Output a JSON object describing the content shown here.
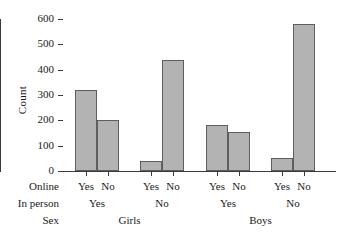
{
  "chart_data": {
    "type": "bar",
    "title": "",
    "xlabel": "",
    "ylabel": "Count",
    "ylim": [
      0,
      600
    ],
    "yticks": [
      0,
      100,
      200,
      300,
      400,
      500,
      600
    ],
    "grid": false,
    "legend": null,
    "categories": [
      "Girls / In person Yes / Online Yes",
      "Girls / In person Yes / Online No",
      "Girls / In person No / Online Yes",
      "Girls / In person No / Online No",
      "Boys / In person Yes / Online Yes",
      "Boys / In person Yes / Online No",
      "Boys / In person No / Online Yes",
      "Boys / In person No / Online No"
    ],
    "values": [
      320,
      200,
      40,
      440,
      180,
      155,
      50,
      580
    ],
    "bar_color": "#b3b3b3",
    "bar_border_color": "#5e5e5e",
    "axis_color": "#3a3a3a",
    "group_labels": {
      "level1_title": "Online",
      "level2_title": "In person",
      "level3_title": "Sex",
      "level1": [
        "Yes",
        "No",
        "Yes",
        "No",
        "Yes",
        "No",
        "Yes",
        "No"
      ],
      "level2": [
        "Yes",
        "No",
        "Yes",
        "No"
      ],
      "level3": [
        "Girls",
        "Boys"
      ]
    }
  },
  "axis": {
    "y_title": "Count",
    "y_tick_labels": [
      "600",
      "500",
      "400",
      "300",
      "200",
      "100",
      "0"
    ]
  },
  "labels": {
    "row1_title": "Online",
    "row2_title": "In person",
    "row3_title": "Sex",
    "online": [
      "Yes",
      "No",
      "Yes",
      "No",
      "Yes",
      "No",
      "Yes",
      "No"
    ],
    "in_person": [
      "Yes",
      "No",
      "Yes",
      "No"
    ],
    "sex": [
      "Girls",
      "Boys"
    ]
  }
}
